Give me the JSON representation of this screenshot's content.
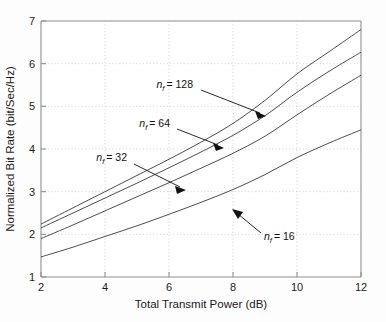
{
  "figure": {
    "background_color": "#fdfdfd",
    "axes_color": "#8a8a8a",
    "grid_color": "#cccccc",
    "curve_color": "#4d4d4d",
    "annotation_color": "#111111"
  },
  "chart_data": {
    "type": "line",
    "title": "",
    "xlabel": "Total Transmit Power (dB)",
    "ylabel": "Normalized Bit Rate (bit/Sec/Hz)",
    "xlim": [
      2,
      12
    ],
    "ylim": [
      1,
      7
    ],
    "xticks": [
      2,
      4,
      6,
      8,
      10,
      12
    ],
    "yticks": [
      1,
      2,
      3,
      4,
      5,
      6,
      7
    ],
    "xtick_labels": [
      "2",
      "4",
      "6",
      "8",
      "10",
      "12"
    ],
    "ytick_labels": [
      "1",
      "2",
      "3",
      "4",
      "5",
      "6",
      "7"
    ],
    "grid": true,
    "grid_style": "dotted",
    "legend": "none",
    "x": [
      2,
      3,
      4,
      5,
      6,
      7,
      8,
      9,
      10,
      11,
      12
    ],
    "series": [
      {
        "name": "n_f = 128",
        "values": [
          2.24,
          2.62,
          3.0,
          3.38,
          3.76,
          4.16,
          4.6,
          5.14,
          5.76,
          6.28,
          6.8
        ]
      },
      {
        "name": "n_f = 64",
        "values": [
          2.15,
          2.5,
          2.85,
          3.2,
          3.56,
          3.93,
          4.32,
          4.78,
          5.33,
          5.82,
          6.27
        ]
      },
      {
        "name": "n_f = 32",
        "values": [
          1.9,
          2.22,
          2.55,
          2.88,
          3.21,
          3.55,
          3.9,
          4.3,
          4.8,
          5.28,
          5.73
        ]
      },
      {
        "name": "n_f = 16",
        "values": [
          1.47,
          1.7,
          1.95,
          2.2,
          2.47,
          2.75,
          3.05,
          3.4,
          3.8,
          4.14,
          4.45
        ]
      }
    ],
    "annotations": [
      {
        "id": "ann-nf-128",
        "text": "n_f = 128",
        "symbol": "n",
        "subscript": "f",
        "equals_value": "= 128",
        "label_x": 193,
        "label_y": 88,
        "arrow_from": [
          225,
          95
        ],
        "arrow_to": [
          266,
          116
        ]
      },
      {
        "id": "ann-nf-64",
        "text": "n_f = 64",
        "symbol": "n",
        "subscript": "f",
        "equals_value": "= 64",
        "label_x": 170,
        "label_y": 127,
        "arrow_from": [
          198,
          133
        ],
        "arrow_to": [
          224,
          148
        ]
      },
      {
        "id": "ann-nf-32",
        "text": "n_f = 32",
        "symbol": "n",
        "subscript": "f",
        "equals_value": "= 32",
        "label_x": 127,
        "label_y": 161,
        "arrow_from": [
          160,
          168
        ],
        "arrow_to": [
          186,
          190
        ]
      },
      {
        "id": "ann-nf-16",
        "text": "n_f = 16",
        "symbol": "n",
        "subscript": "f",
        "equals_value": "= 16",
        "label_x": 264,
        "label_y": 236,
        "arrow_from": [
          260,
          229
        ],
        "arrow_to": [
          233,
          210
        ]
      }
    ]
  }
}
